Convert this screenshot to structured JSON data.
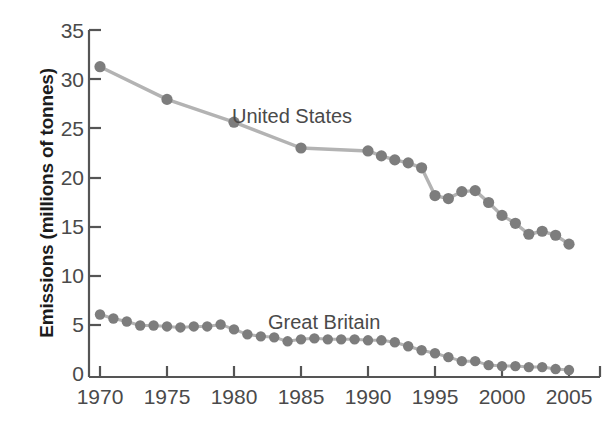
{
  "chart_data": {
    "type": "line",
    "title": "",
    "xlabel": "",
    "ylabel": "Emissions (millions of tonnes)",
    "xlim": [
      1968.5,
      2006.5
    ],
    "ylim": [
      0,
      35
    ],
    "xticks": [
      1970,
      1975,
      1980,
      1985,
      1990,
      1995,
      2000,
      2005
    ],
    "yticks": [
      0,
      5,
      10,
      15,
      20,
      25,
      30,
      35
    ],
    "grid": false,
    "legend_position": "inline-annotation",
    "marker": "circle",
    "marker_color": "#7d7d7d",
    "line_color": "#b3b3b3",
    "series": [
      {
        "name": "United States",
        "x": [
          1970,
          1975,
          1980,
          1985,
          1990,
          1991,
          1992,
          1993,
          1994,
          1995,
          1996,
          1997,
          1998,
          1999,
          2000,
          2001,
          2002,
          2003,
          2004,
          2005
        ],
        "values": [
          31.3,
          28.0,
          25.7,
          23.1,
          22.8,
          22.3,
          21.9,
          21.6,
          21.1,
          18.3,
          18.0,
          18.7,
          18.8,
          17.6,
          16.3,
          15.5,
          14.4,
          14.7,
          14.3,
          13.4
        ]
      },
      {
        "name": "Great Britain",
        "x": [
          1970,
          1971,
          1972,
          1973,
          1974,
          1975,
          1976,
          1977,
          1978,
          1979,
          1980,
          1981,
          1982,
          1983,
          1984,
          1985,
          1986,
          1987,
          1988,
          1989,
          1990,
          1991,
          1992,
          1993,
          1994,
          1995,
          1996,
          1997,
          1998,
          1999,
          2000,
          2001,
          2002,
          2003,
          2004,
          2005
        ],
        "values": [
          6.3,
          5.9,
          5.6,
          5.2,
          5.2,
          5.1,
          5.0,
          5.1,
          5.1,
          5.3,
          4.8,
          4.3,
          4.1,
          4.0,
          3.6,
          3.8,
          3.9,
          3.8,
          3.8,
          3.8,
          3.7,
          3.7,
          3.5,
          3.1,
          2.7,
          2.4,
          2.0,
          1.6,
          1.6,
          1.2,
          1.1,
          1.1,
          1.0,
          1.0,
          0.8,
          0.7
        ]
      }
    ],
    "annotations": [
      {
        "text": "United States",
        "series": "United States"
      },
      {
        "text": "Great Britain",
        "series": "Great Britain"
      }
    ]
  },
  "axis": {
    "y_title": "Emissions (millions of tonnes)",
    "y_tick_labels": [
      "35",
      "30",
      "25",
      "20",
      "15",
      "10",
      "5",
      "0"
    ],
    "x_tick_labels": [
      "1970",
      "1975",
      "1980",
      "1985",
      "1990",
      "1995",
      "2000",
      "2005"
    ]
  },
  "labels": {
    "united_states": "United States",
    "great_britain": "Great Britain"
  },
  "colors": {
    "marker": "#7d7d7d",
    "line": "#b3b3b3",
    "axis": "#555555",
    "text": "#4a4a4a",
    "title_text": "#1c1c1c",
    "background": "#ffffff"
  }
}
